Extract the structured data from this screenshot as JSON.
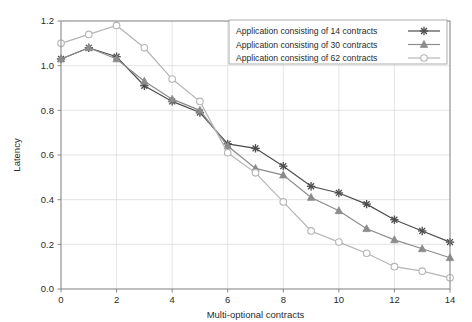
{
  "chart_data": {
    "type": "line",
    "title": "",
    "xlabel": "Multi-optional contracts",
    "ylabel": "Latency",
    "xlim": [
      0,
      14
    ],
    "ylim": [
      0.0,
      1.2
    ],
    "xticks": [
      0,
      2,
      4,
      6,
      8,
      10,
      12,
      14
    ],
    "xtick_labels": [
      "0",
      "2",
      "4",
      "6",
      "8",
      "10",
      "12",
      "14"
    ],
    "yticks": [
      0.0,
      0.2,
      0.4,
      0.6,
      0.8,
      1.0,
      1.2
    ],
    "ytick_labels": [
      "0.0",
      "0.2",
      "0.4",
      "0.6",
      "0.8",
      "1.0",
      "1.2"
    ],
    "grid": true,
    "legend_position": "upper right",
    "x": [
      0,
      1,
      2,
      3,
      4,
      5,
      6,
      7,
      8,
      9,
      10,
      11,
      12,
      13,
      14
    ],
    "series": [
      {
        "name": "Application consisting of 14 contracts",
        "marker": "star",
        "color": "#4d4d4d",
        "values": [
          1.03,
          1.08,
          1.04,
          0.91,
          0.84,
          0.79,
          0.65,
          0.63,
          0.55,
          0.46,
          0.43,
          0.38,
          0.31,
          0.26,
          0.21
        ]
      },
      {
        "name": "Application consisting of 30 contracts",
        "marker": "triangle",
        "color": "#8c8c8c",
        "values": [
          1.03,
          1.08,
          1.03,
          0.93,
          0.85,
          0.8,
          0.64,
          0.54,
          0.51,
          0.41,
          0.35,
          0.27,
          0.22,
          0.18,
          0.14
        ]
      },
      {
        "name": "Application consisting of 62 contracts",
        "marker": "circle",
        "color": "#b5b5b5",
        "values": [
          1.1,
          1.14,
          1.18,
          1.08,
          0.94,
          0.84,
          0.61,
          0.52,
          0.39,
          0.26,
          0.21,
          0.16,
          0.1,
          0.08,
          0.05
        ]
      }
    ]
  }
}
